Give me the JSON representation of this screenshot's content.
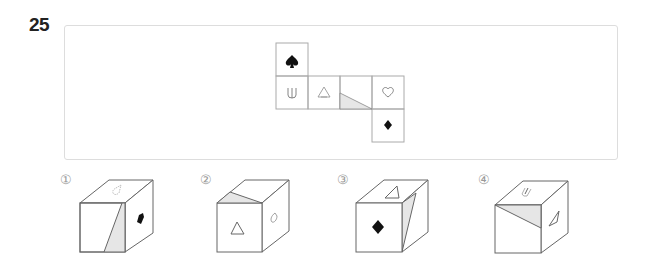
{
  "question": {
    "number": "25"
  },
  "net": {
    "faces": [
      {
        "position": "top",
        "symbol": "spade",
        "glyph": "♠"
      },
      {
        "position": "row-1",
        "symbol": "fork-u",
        "glyph": "⋓"
      },
      {
        "position": "row-2",
        "symbol": "triangle-outline",
        "glyph": "△"
      },
      {
        "position": "row-3",
        "symbol": "shaded-triangle"
      },
      {
        "position": "row-4",
        "symbol": "heart-outline",
        "glyph": "♡"
      },
      {
        "position": "bottom",
        "symbol": "diamond",
        "glyph": "◆"
      }
    ]
  },
  "options": [
    {
      "label": "①",
      "top": "heart-outline",
      "front": "shaded-triangle",
      "right": "spade"
    },
    {
      "label": "②",
      "top": "shaded-triangle",
      "front": "triangle-outline",
      "right": "heart-outline"
    },
    {
      "label": "③",
      "top": "triangle-outline",
      "front": "diamond",
      "right": "shaded-triangle"
    },
    {
      "label": "④",
      "top": "fork-u",
      "front": "shaded-triangle",
      "right": "triangle-outline"
    }
  ],
  "colors": {
    "line": "#888888",
    "shade": "#e6e6e6",
    "panel_border": "#dddddd",
    "text": "#222222"
  }
}
